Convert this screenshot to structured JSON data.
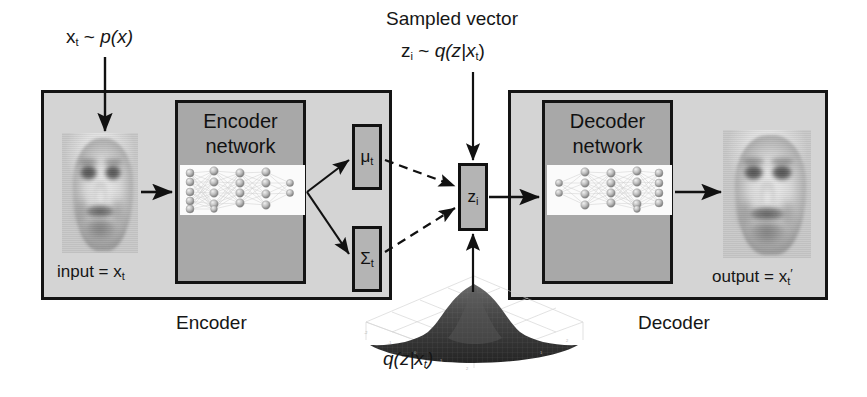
{
  "diagram": {
    "title_top": "Sampled vector",
    "top_label": {
      "input_dist": "x",
      "input_dist_sub": "t",
      "tilde": "~",
      "input_dist_fn": "p(x)"
    },
    "sampled": {
      "caption": "Sampled vector",
      "z": "z",
      "z_sub": "i",
      "tilde": "~",
      "dist": "q(z|x",
      "dist_sub": "t",
      "dist_close": ")"
    },
    "encoder": {
      "outer_label": "Encoder",
      "network_title_line1": "Encoder",
      "network_title_line2": "network",
      "input_caption_prefix": "input = x",
      "input_caption_sub": "t"
    },
    "decoder": {
      "outer_label": "Decoder",
      "network_title_line1": "Decoder",
      "network_title_line2": "network",
      "output_caption_prefix": "output = x",
      "output_caption_sub": "t",
      "output_caption_prime": "′"
    },
    "latent": {
      "mu": "μ",
      "mu_sub": "t",
      "sigma": "Σ",
      "sigma_sub": "t",
      "zi": "z",
      "zi_sub": "i"
    },
    "gaussian": {
      "label_prefix": "q(z|x",
      "label_sub": "t",
      "label_close": ")"
    },
    "colors": {
      "outer_fill": "#d4d4d4",
      "network_fill": "#a8a8a8",
      "small_box_fill": "#b4b4b4",
      "stroke": "#141414",
      "page_bg": "#ffffff",
      "nn_panel": "#fbfbfb",
      "gaussian_surface": "#3c3c3c"
    }
  }
}
